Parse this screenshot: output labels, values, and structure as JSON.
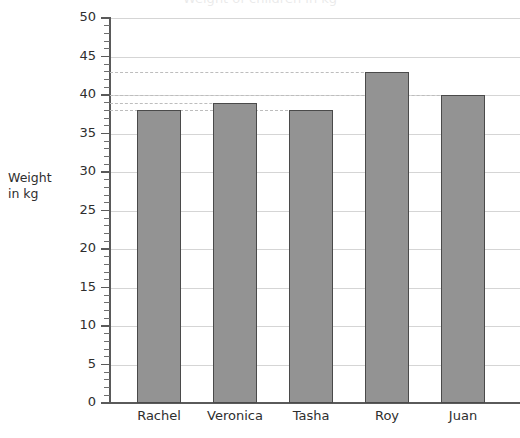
{
  "chart_data": {
    "type": "bar",
    "title": "Weight of children in kg",
    "title_clipped": true,
    "categories": [
      "Rachel",
      "Veronica",
      "Tasha",
      "Roy",
      "Juan"
    ],
    "values": [
      38,
      39,
      38,
      43,
      40
    ],
    "xlabel": "",
    "ylabel": "Weight\nin kg",
    "ylabel_line1": "Weight",
    "ylabel_line2": "in kg",
    "ylim": [
      0,
      50
    ],
    "y_major_step": 5,
    "y_minor_step": 1,
    "y_ticks": [
      0,
      5,
      10,
      15,
      20,
      25,
      30,
      35,
      40,
      45,
      50
    ],
    "y_tick_labels": [
      "0",
      "5",
      "10",
      "15",
      "20",
      "25",
      "30",
      "35",
      "40",
      "45",
      "50"
    ],
    "grid": true,
    "grid_axis": "y",
    "legend": false,
    "reference_lines": [
      38,
      39,
      40,
      43
    ],
    "bar_color": "#939393",
    "bar_border_color": "#4a4a4a",
    "gridline_color": "#d5d5d5",
    "refline_color": "#bdbdbd",
    "axis_color": "#5a5a5a",
    "background": "#ffffff"
  }
}
